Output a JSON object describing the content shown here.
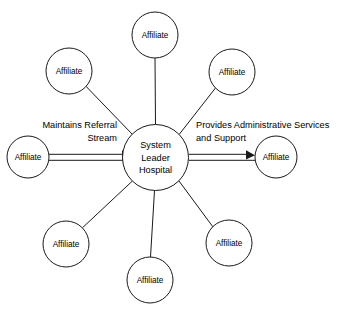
{
  "diagram": {
    "type": "hub-and-spoke",
    "hub": {
      "label_lines": [
        "System",
        "Leader",
        "Hospital"
      ],
      "line1": "System",
      "line2": "Leader",
      "line3": "Hospital",
      "cx": 155.5,
      "cy": 157.5,
      "r": 33
    },
    "node_label": "Affiliate",
    "nodes": [
      {
        "id": "affiliate-top",
        "label": "Affiliate",
        "cx": 155,
        "cy": 35,
        "r": 23,
        "position": "top"
      },
      {
        "id": "affiliate-top-left",
        "label": "Affiliate",
        "cx": 69,
        "cy": 71,
        "r": 23,
        "position": "top-left"
      },
      {
        "id": "affiliate-top-right",
        "label": "Affiliate",
        "cx": 232,
        "cy": 72,
        "r": 23,
        "position": "top-right"
      },
      {
        "id": "affiliate-left",
        "label": "Affiliate",
        "cx": 28,
        "cy": 157,
        "r": 21,
        "position": "left"
      },
      {
        "id": "affiliate-right",
        "label": "Affiliate",
        "cx": 276,
        "cy": 157,
        "r": 21,
        "position": "right"
      },
      {
        "id": "affiliate-bottom-left",
        "label": "Affiliate",
        "cx": 66,
        "cy": 244,
        "r": 23,
        "position": "bottom-left"
      },
      {
        "id": "affiliate-bottom-right",
        "label": "Affiliate",
        "cx": 229,
        "cy": 243,
        "r": 23,
        "position": "bottom-right"
      },
      {
        "id": "affiliate-bottom",
        "label": "Affiliate",
        "cx": 150,
        "cy": 280,
        "r": 23,
        "position": "bottom"
      }
    ],
    "edge_labels": {
      "left": {
        "line1": "Maintains Referral",
        "line2": "Stream",
        "align": "right"
      },
      "right": {
        "line1": "Provides Administrative Services",
        "line2": "and Support",
        "align": "left"
      }
    },
    "colors": {
      "stroke": "#1a1a1a",
      "fill": "#ffffff",
      "text": "#000000",
      "background": "#ffffff"
    }
  }
}
